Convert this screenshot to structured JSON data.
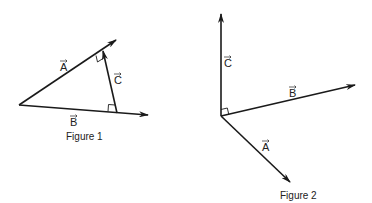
{
  "figure1": {
    "caption": "Figure 1",
    "vectors": [
      {
        "name": "A",
        "label": "A",
        "from": [
          19,
          105
        ],
        "to": [
          116,
          40
        ]
      },
      {
        "name": "B",
        "label": "B",
        "from": [
          19,
          105
        ],
        "to": [
          148,
          115
        ]
      },
      {
        "name": "C",
        "label": "C",
        "from": [
          117,
          113
        ],
        "to": [
          103,
          51
        ]
      }
    ],
    "right_angles": [
      "between C and A",
      "between C and B"
    ]
  },
  "figure2": {
    "caption": "Figure 2",
    "vectors": [
      {
        "name": "A",
        "label": "A",
        "from": [
          221,
          116
        ],
        "to": [
          290,
          182
        ]
      },
      {
        "name": "B",
        "label": "B",
        "from": [
          221,
          116
        ],
        "to": [
          355,
          85
        ]
      },
      {
        "name": "C",
        "label": "C",
        "from": [
          221,
          116
        ],
        "to": [
          221,
          14
        ]
      }
    ],
    "right_angles": [
      "between C and B"
    ]
  }
}
